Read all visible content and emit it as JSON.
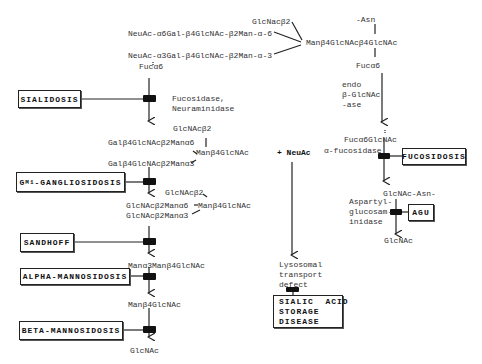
{
  "diagram": {
    "type": "metabolic-pathway",
    "starting_structure": {
      "branch_top_extra": "GlcNacβ2",
      "branch_a6": "NeuAc-α6Gal-β4GlcNAc-β2Man-α-6",
      "branch_a3": "NeuAc-α3Gal-β4GlcNAc-β2Man-α-3",
      "fuc_left": "Fucα6",
      "core": "Manβ4GlcNAcβ4GlcNAc",
      "asn": "-Asn",
      "fuc_core": "Fucα6"
    },
    "left_pathway": {
      "enzyme_1": "Fucosidase,\nNeuraminidase",
      "intermediate_1": {
        "top": "GlcNAcβ2",
        "a6": "Galβ4GlcNAcβ2Manα6",
        "core": "Manβ4GlcNAc",
        "a3": "Galβ4GlcNAcβ2Manα3"
      },
      "intermediate_2": {
        "top": "GlcNAcβ2",
        "a6": "GlcNAcβ2Manα6",
        "core": "Manβ4GlcNAc",
        "a3": "GlcNAcβ2Manα3"
      },
      "intermediate_3": "Manα3Manβ4GlcNAc",
      "intermediate_4": "Manβ4GlcNAc",
      "product": "GlcNAc"
    },
    "middle_pathway": {
      "released": "+ NeuAc",
      "defect_label": "Lysosomal\ntransport\ndefect"
    },
    "right_pathway": {
      "enzyme_1": "endo\nβ-GlcNAc\n-ase",
      "intermediate_1": "Fucα6GlcNAc",
      "enzyme_2": "α-fucosidase",
      "intermediate_2": "GlcNAc-Asn-",
      "enzyme_3": "Aspartyl-\nglucosam-\ninidase",
      "product": "GlcNAc"
    },
    "diseases": [
      {
        "id": "sialidosis",
        "label": "SIALIDOSIS"
      },
      {
        "id": "gm1",
        "label_main": "G",
        "label_sub": "M1",
        "label_rest": "-GANGLIOSIDOSIS"
      },
      {
        "id": "sandhoff",
        "label": "SANDHOFF"
      },
      {
        "id": "alpha-mannosidosis",
        "label": "ALPHA-MANNOSIDOSIS"
      },
      {
        "id": "beta-mannosidosis",
        "label": "BETA-MANNOSIDOSIS"
      },
      {
        "id": "fucosidosis",
        "label": "FUCOSIDOSIS"
      },
      {
        "id": "agu",
        "label": "AGU"
      },
      {
        "id": "sialic-acid-storage",
        "label": "SIALIC  ACID\nSTORAGE\nDISEASE"
      }
    ],
    "colors": {
      "line": "#222222",
      "text": "#333333",
      "background": "#ffffff"
    }
  }
}
